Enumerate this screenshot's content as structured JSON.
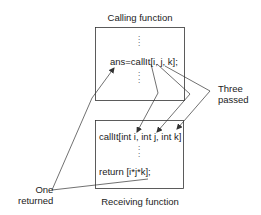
{
  "diagram": {
    "top_box": {
      "title": "Calling function",
      "call_statement": "ans=callIt[i, j, k];",
      "dots_above": ":",
      "dots_below": ":"
    },
    "bottom_box": {
      "title": "Receiving function",
      "signature": "callIt[int i, int j, int k]",
      "dots": ":",
      "return_statement": "return [i*j*k];"
    },
    "annotations": {
      "passed": {
        "line1": "Three",
        "line2": "passed"
      },
      "returned": {
        "line1": "One",
        "line2": "returned"
      }
    },
    "colors": {
      "line": "#333333",
      "text": "#222222",
      "background": "#ffffff"
    }
  }
}
